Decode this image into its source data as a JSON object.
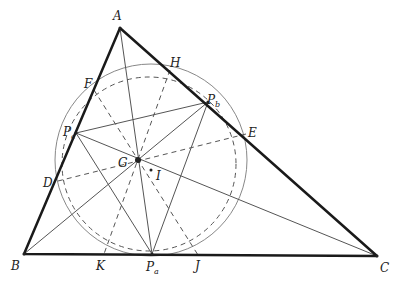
{
  "diagram": {
    "type": "triangle-geometry",
    "points": {
      "A": {
        "label": "A",
        "x": 120,
        "y": 28,
        "lx": 113,
        "ly": 20
      },
      "B": {
        "label": "B",
        "x": 24,
        "y": 254,
        "lx": 11,
        "ly": 270
      },
      "C": {
        "label": "C",
        "x": 377,
        "y": 256,
        "lx": 380,
        "ly": 272
      },
      "H": {
        "label": "H",
        "x": 170,
        "y": 70,
        "lx": 170,
        "ly": 67
      },
      "F": {
        "label": "F",
        "x": 94,
        "y": 90,
        "lx": 84,
        "ly": 88
      },
      "Pb": {
        "label": "P",
        "sub": "b",
        "x": 208,
        "y": 102,
        "lx": 208,
        "ly": 103
      },
      "E": {
        "label": "E",
        "x": 246,
        "y": 134,
        "lx": 248,
        "ly": 136
      },
      "Pc": {
        "label": "P",
        "sub": "c",
        "x": 76,
        "y": 133,
        "lx": 64,
        "ly": 135
      },
      "D": {
        "label": "D",
        "x": 58,
        "y": 181,
        "lx": 43,
        "ly": 186
      },
      "G": {
        "label": "G",
        "x": 138,
        "y": 160,
        "lx": 118,
        "ly": 166
      },
      "I": {
        "label": "I",
        "x": 151,
        "y": 170,
        "lx": 156,
        "ly": 180
      },
      "K": {
        "label": "K",
        "x": 104,
        "y": 254,
        "lx": 96,
        "ly": 270
      },
      "Pa": {
        "label": "P",
        "sub": "a",
        "x": 152,
        "y": 254,
        "lx": 147,
        "ly": 271
      },
      "J": {
        "label": "J",
        "x": 198,
        "y": 255,
        "lx": 195,
        "ly": 270
      }
    },
    "circles": [
      {
        "name": "outer-circle",
        "cx": 151,
        "cy": 160,
        "r": 96,
        "style": "solid"
      },
      {
        "name": "inner-circle",
        "cx": 150,
        "cy": 165,
        "r": 86,
        "style": "dashed"
      }
    ],
    "colors": {
      "triangle": "#1a1a1a",
      "thin": "#666666",
      "dashed": "#555555"
    }
  }
}
